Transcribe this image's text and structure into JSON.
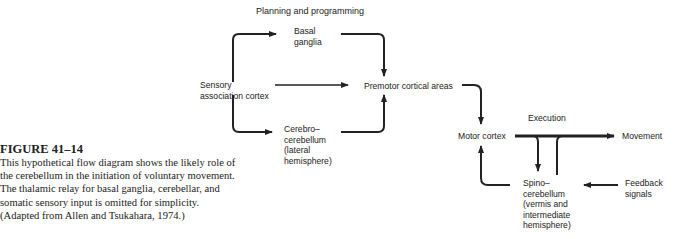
{
  "figure": {
    "number": "FIGURE 41–14",
    "caption": "This hypothetical flow diagram shows the likely role of the cerebellum in the initiation of voluntary movement. The thalamic relay for basal ganglia, cerebellar, and somatic sensory input is omitted for simplicity. (Adapted from Allen and Tsukahara, 1974.)"
  },
  "diagram": {
    "section_labels": {
      "planning": "Planning and programming",
      "execution": "Execution"
    },
    "nodes": {
      "sensory_1": "Sensory",
      "sensory_2": "association cortex",
      "basal_1": "Basal",
      "basal_2": "ganglia",
      "cerebro_1": "Cerebro–",
      "cerebro_2": "cerebellum",
      "cerebro_3": "(lateral",
      "cerebro_4": "hemisphere)",
      "premotor": "Premotor cortical areas",
      "motor": "Motor cortex",
      "movement": "Movement",
      "spino_1": "Spino–",
      "spino_2": "cerebellum",
      "spino_3": "(vermis and",
      "spino_4": "intermediate",
      "spino_5": "hemisphere)",
      "feedback_1": "Feedback",
      "feedback_2": "signals"
    },
    "edges": [
      {
        "from": "Sensory association cortex",
        "to": "Basal ganglia"
      },
      {
        "from": "Sensory association cortex",
        "to": "Premotor cortical areas"
      },
      {
        "from": "Sensory association cortex",
        "to": "Cerebrocerebellum"
      },
      {
        "from": "Basal ganglia",
        "to": "Premotor cortical areas"
      },
      {
        "from": "Cerebrocerebellum",
        "to": "Premotor cortical areas"
      },
      {
        "from": "Premotor cortical areas",
        "to": "Motor cortex"
      },
      {
        "from": "Motor cortex",
        "to": "Movement"
      },
      {
        "from": "Motor cortex",
        "to": "Spinocerebellum"
      },
      {
        "from": "Spinocerebellum",
        "to": "Motor cortex"
      },
      {
        "from": "Feedback signals",
        "to": "Spinocerebellum"
      }
    ]
  }
}
